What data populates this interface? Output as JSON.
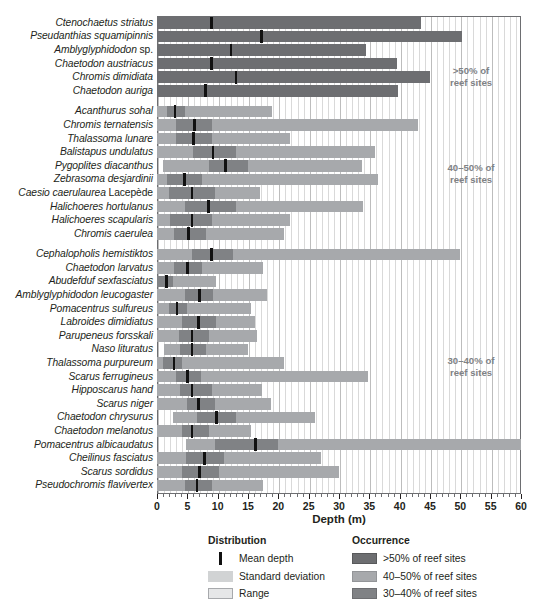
{
  "chart_data": {
    "type": "bar",
    "title": "",
    "xlabel": "Depth (m)",
    "ylabel": "",
    "xlim": [
      0,
      60
    ],
    "xticks": [
      0,
      5,
      10,
      15,
      20,
      25,
      30,
      35,
      40,
      45,
      50,
      55,
      60
    ],
    "grid": true,
    "legend_position": "bottom",
    "legend": {
      "distribution_title": "Distribution",
      "occurrence_title": "Occurrence",
      "distribution_items": [
        {
          "key": "mean",
          "label": "Mean depth"
        },
        {
          "key": "sd",
          "label": "Standard deviation"
        },
        {
          "key": "range",
          "label": "Range"
        }
      ],
      "occurrence_items": [
        {
          "key": "occ1",
          "label": ">50% of reef sites"
        },
        {
          "key": "occ2",
          "label": "40–50% of reef sites"
        },
        {
          "key": "occ3",
          "label": "30–40% of reef sites"
        }
      ]
    },
    "colors": {
      "occurrence_gt50": "#6d6e71",
      "occurrence_40_50": "#a7a9ac",
      "occurrence_30_40": "#808285",
      "mean_marker": "#111111",
      "grid": "#d9d9d9",
      "frame": "#6d6e71",
      "text": "#231f20",
      "group_note": "#808285"
    },
    "groups": [
      {
        "id": "gt50",
        "note": ">50% of\nreef sites",
        "note_line1": ">50% of",
        "note_line2": "reef sites",
        "species": [
          {
            "name": "Ctenochaetus striatus",
            "range": [
              0,
              43.5
            ],
            "sd": [
              0,
              43.5
            ],
            "mean": 9.0
          },
          {
            "name": "Pseudanthias squamipinnis",
            "range": [
              0,
              50.3
            ],
            "sd": [
              0,
              50.3
            ],
            "mean": 17.2
          },
          {
            "name": "Amblyglyphidodon sp.",
            "range": [
              0,
              34.5
            ],
            "sd": [
              0,
              34.5
            ],
            "mean": 12.2,
            "name_upright_suffix": "sp."
          },
          {
            "name": "Chaetodon austriacus",
            "range": [
              0,
              39.5
            ],
            "sd": [
              0,
              39.5
            ],
            "mean": 9.0
          },
          {
            "name": "Chromis dimidiata",
            "range": [
              0,
              45.0
            ],
            "sd": [
              0,
              45.0
            ],
            "mean": 13.0
          },
          {
            "name": "Chaetodon auriga",
            "range": [
              0,
              39.8
            ],
            "sd": [
              0,
              39.8
            ],
            "mean": 8.0
          }
        ]
      },
      {
        "id": "p40_50",
        "note_line1": "40–50% of",
        "note_line2": "reef sites",
        "species": [
          {
            "name": "Acanthurus sohal",
            "range": [
              0,
              19.0
            ],
            "sd": [
              1.6,
              4.6
            ],
            "mean": 3.0
          },
          {
            "name": "Chromis ternatensis",
            "range": [
              0,
              43.0
            ],
            "sd": [
              3.2,
              9.0
            ],
            "mean": 6.2
          },
          {
            "name": "Thalassoma lunare",
            "range": [
              0,
              22.0
            ],
            "sd": [
              3.2,
              9.0
            ],
            "mean": 6.0
          },
          {
            "name": "Balistapus undulatus",
            "range": [
              0,
              36.0
            ],
            "sd": [
              6.0,
              13.0
            ],
            "mean": 9.2
          },
          {
            "name": "Pygoplites diacanthus",
            "range": [
              1.0,
              33.8
            ],
            "sd": [
              8.5,
              15.0
            ],
            "mean": 11.3
          },
          {
            "name": "Zebrasoma desjardinii",
            "range": [
              0,
              36.4
            ],
            "sd": [
              1.6,
              7.5
            ],
            "mean": 4.5
          },
          {
            "name": "Caesio caerulaurea Lacepède",
            "range": [
              0,
              17.0
            ],
            "sd": [
              2.0,
              9.5
            ],
            "mean": 5.8,
            "name_upright_suffix": "Lacepède"
          },
          {
            "name": "Halichoeres hortulanus",
            "range": [
              0,
              34.0
            ],
            "sd": [
              4.6,
              13.0
            ],
            "mean": 8.5
          },
          {
            "name": "Halichoeres scapularis",
            "range": [
              0,
              22.0
            ],
            "sd": [
              2.2,
              9.0
            ],
            "mean": 5.8
          },
          {
            "name": "Chromis caerulea",
            "range": [
              0,
              21.0
            ],
            "sd": [
              2.8,
              8.0
            ],
            "mean": 5.2
          }
        ]
      },
      {
        "id": "p30_40",
        "note_line1": "30–40% of",
        "note_line2": "reef sites",
        "species": [
          {
            "name": "Cephalopholis hemistiktos",
            "range": [
              0,
              50.0
            ],
            "sd": [
              5.8,
              12.5
            ],
            "mean": 9.0
          },
          {
            "name": "Chaetodon larvatus",
            "range": [
              0,
              17.5
            ],
            "sd": [
              2.8,
              7.5
            ],
            "mean": 5.0
          },
          {
            "name": "Abudefduf sexfasciatus",
            "range": [
              0,
              9.8
            ],
            "sd": [
              0,
              2.6
            ],
            "mean": 1.6
          },
          {
            "name": "Amblyglyphidodon leucogaster",
            "range": [
              0,
              18.2
            ],
            "sd": [
              4.6,
              9.2
            ],
            "mean": 7.0
          },
          {
            "name": "Pomacentrus sulfureus",
            "range": [
              0,
              15.5
            ],
            "sd": [
              2.0,
              5.0
            ],
            "mean": 3.3
          },
          {
            "name": "Labroides dimidiatus",
            "range": [
              0,
              16.2
            ],
            "sd": [
              4.2,
              9.8
            ],
            "mean": 6.8
          },
          {
            "name": "Parupeneus forsskali",
            "range": [
              0,
              16.5
            ],
            "sd": [
              3.6,
              8.6
            ],
            "mean": 5.8
          },
          {
            "name": "Naso lituratus",
            "range": [
              1.2,
              15.0
            ],
            "sd": [
              3.8,
              8.0
            ],
            "mean": 5.8
          },
          {
            "name": "Thalassoma purpureum",
            "range": [
              0,
              21.0
            ],
            "sd": [
              1.0,
              4.2
            ],
            "mean": 2.8
          },
          {
            "name": "Scarus ferrugineus",
            "range": [
              0,
              34.8
            ],
            "sd": [
              3.2,
              7.2
            ],
            "mean": 5.0
          },
          {
            "name": "Hipposcarus hand",
            "range": [
              0,
              17.3
            ],
            "sd": [
              3.8,
              9.0
            ],
            "mean": 5.8
          },
          {
            "name": "Scarus niger",
            "range": [
              0,
              18.8
            ],
            "sd": [
              5.0,
              9.6
            ],
            "mean": 6.8
          },
          {
            "name": "Chaetodon chrysurus",
            "range": [
              2.6,
              26.0
            ],
            "sd": [
              6.6,
              13.0
            ],
            "mean": 9.8
          },
          {
            "name": "Chaetodon melanotus",
            "range": [
              0,
              15.5
            ],
            "sd": [
              4.2,
              8.6
            ],
            "mean": 5.8
          },
          {
            "name": "Pomacentrus albicaudatus",
            "range": [
              4.8,
              60.0
            ],
            "sd": [
              9.5,
              20.0
            ],
            "mean": 16.2
          },
          {
            "name": "Cheilinus fasciatus",
            "range": [
              0,
              27.0
            ],
            "sd": [
              4.8,
              11.0
            ],
            "mean": 7.8
          },
          {
            "name": "Scarus sordidus",
            "range": [
              0,
              30.0
            ],
            "sd": [
              4.2,
              10.2
            ],
            "mean": 7.0
          },
          {
            "name": "Pseudochromis flavivertex",
            "range": [
              0,
              17.5
            ],
            "sd": [
              4.6,
              9.0
            ],
            "mean": 6.6
          }
        ]
      }
    ]
  }
}
